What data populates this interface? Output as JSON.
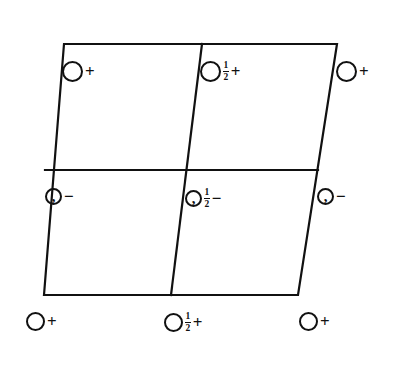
{
  "diagram": {
    "type": "crystallographic-space-group-diagram",
    "title": "",
    "background_color": "#ffffff",
    "line_color": "#111111",
    "symbol_color": "#111111"
  },
  "cell": {
    "corners": {
      "top_left": {
        "x": 64,
        "y": 44
      },
      "top_right": {
        "x": 337,
        "y": 44
      },
      "bottom_right": {
        "x": 298,
        "y": 295
      },
      "bottom_left": {
        "x": 44,
        "y": 295
      }
    },
    "dividers": {
      "horizontal": {
        "x1": 45,
        "y1": 170,
        "x2": 318,
        "y2": 170
      },
      "vertical": {
        "x1": 202,
        "y1": 44,
        "x2": 171,
        "y2": 295
      }
    },
    "stroke_width": 2.2,
    "subdivisions": 4
  },
  "sites": [
    {
      "id": "site-top-left",
      "symbol": "open-circle",
      "height": "",
      "sign": "+",
      "x": 62,
      "y": 61,
      "size": "big"
    },
    {
      "id": "site-top-center",
      "symbol": "open-circle",
      "height": "1/2",
      "sign": "+",
      "x": 200,
      "y": 61,
      "size": "big"
    },
    {
      "id": "site-top-right",
      "symbol": "open-circle",
      "height": "",
      "sign": "+",
      "x": 336,
      "y": 61,
      "size": "big"
    },
    {
      "id": "site-middle-left",
      "symbol": "comma-circle",
      "height": "",
      "sign": "−",
      "x": 45,
      "y": 188,
      "size": "small"
    },
    {
      "id": "site-middle-center",
      "symbol": "comma-circle",
      "height": "1/2",
      "sign": "−",
      "x": 185,
      "y": 188,
      "size": "small"
    },
    {
      "id": "site-middle-right",
      "symbol": "comma-circle",
      "height": "",
      "sign": "−",
      "x": 317,
      "y": 188,
      "size": "small"
    },
    {
      "id": "site-bottom-left",
      "symbol": "open-circle",
      "height": "",
      "sign": "+",
      "x": 26,
      "y": 312,
      "size": "small"
    },
    {
      "id": "site-bottom-center",
      "symbol": "open-circle",
      "height": "1/2",
      "sign": "+",
      "x": 164,
      "y": 312,
      "size": "small"
    },
    {
      "id": "site-bottom-right",
      "symbol": "open-circle",
      "height": "",
      "sign": "+",
      "x": 299,
      "y": 312,
      "size": "small"
    }
  ],
  "fraction": {
    "numerator": "1",
    "denominator": "2"
  },
  "comma_glyph": ","
}
